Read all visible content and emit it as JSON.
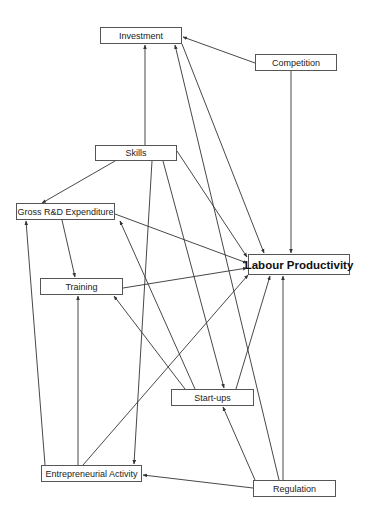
{
  "diagram": {
    "title": "",
    "nodes": [
      {
        "id": "investment",
        "label": "Investment",
        "x": 100,
        "y": 27,
        "w": 82,
        "h": 17
      },
      {
        "id": "competition",
        "label": "Competition",
        "x": 255,
        "y": 54,
        "w": 82,
        "h": 17
      },
      {
        "id": "skills",
        "label": "Skills",
        "x": 95,
        "y": 145,
        "w": 82,
        "h": 16
      },
      {
        "id": "gross_rd",
        "label": "Gross R&D Expenditure",
        "x": 16,
        "y": 203,
        "w": 99,
        "h": 17
      },
      {
        "id": "labour_productivity",
        "label": "Labour Productivity",
        "x": 248,
        "y": 254,
        "w": 102,
        "h": 21,
        "main": true
      },
      {
        "id": "training",
        "label": "Training",
        "x": 40,
        "y": 278,
        "w": 83,
        "h": 17
      },
      {
        "id": "startups",
        "label": "Start-ups",
        "x": 171,
        "y": 389,
        "w": 83,
        "h": 17
      },
      {
        "id": "entrepreneurial",
        "label": "Entrepreneurial Activity",
        "x": 41,
        "y": 465,
        "w": 101,
        "h": 17
      },
      {
        "id": "regulation",
        "label": "Regulation",
        "x": 253,
        "y": 480,
        "w": 83,
        "h": 17
      }
    ],
    "edges": [
      {
        "from": "competition",
        "to": "investment",
        "x1": 255,
        "y1": 63,
        "x2": 183,
        "y2": 37
      },
      {
        "from": "competition",
        "to": "labour_productivity",
        "x1": 291,
        "y1": 71,
        "x2": 291,
        "y2": 253
      },
      {
        "from": "skills",
        "to": "investment",
        "x1": 145,
        "y1": 145,
        "x2": 145,
        "y2": 45
      },
      {
        "from": "skills",
        "to": "gross_rd",
        "x1": 115,
        "y1": 161,
        "x2": 42,
        "y2": 203
      },
      {
        "from": "skills",
        "to": "labour_productivity",
        "x1": 177,
        "y1": 151,
        "x2": 247,
        "y2": 257
      },
      {
        "from": "skills",
        "to": "startups",
        "x1": 163,
        "y1": 161,
        "x2": 224,
        "y2": 388
      },
      {
        "from": "skills",
        "to": "entrepreneurial",
        "x1": 152,
        "y1": 161,
        "x2": 134,
        "y2": 464
      },
      {
        "from": "investment",
        "to": "labour_productivity",
        "x1": 182,
        "y1": 44,
        "x2": 264,
        "y2": 253
      },
      {
        "from": "regulation",
        "to": "investment",
        "x1": 279,
        "y1": 480,
        "x2": 175,
        "y2": 45
      },
      {
        "from": "gross_rd",
        "to": "training",
        "x1": 62,
        "y1": 220,
        "x2": 75,
        "y2": 277
      },
      {
        "from": "gross_rd",
        "to": "labour_productivity",
        "x1": 115,
        "y1": 214,
        "x2": 247,
        "y2": 263
      },
      {
        "from": "training",
        "to": "labour_productivity",
        "x1": 123,
        "y1": 288,
        "x2": 247,
        "y2": 268
      },
      {
        "from": "startups",
        "to": "gross_rd",
        "x1": 195,
        "y1": 389,
        "x2": 120,
        "y2": 221
      },
      {
        "from": "startups",
        "to": "training",
        "x1": 185,
        "y1": 389,
        "x2": 114,
        "y2": 296
      },
      {
        "from": "startups",
        "to": "labour_productivity",
        "x1": 236,
        "y1": 389,
        "x2": 270,
        "y2": 276
      },
      {
        "from": "entrepreneurial",
        "to": "gross_rd",
        "x1": 45,
        "y1": 465,
        "x2": 26,
        "y2": 221
      },
      {
        "from": "entrepreneurial",
        "to": "training",
        "x1": 78,
        "y1": 465,
        "x2": 78,
        "y2": 296
      },
      {
        "from": "entrepreneurial",
        "to": "labour_productivity",
        "x1": 83,
        "y1": 465,
        "x2": 248,
        "y2": 275
      },
      {
        "from": "regulation",
        "to": "startups",
        "x1": 255,
        "y1": 480,
        "x2": 223,
        "y2": 407
      },
      {
        "from": "regulation",
        "to": "entrepreneurial",
        "x1": 253,
        "y1": 488,
        "x2": 143,
        "y2": 475
      },
      {
        "from": "regulation",
        "to": "labour_productivity",
        "x1": 283,
        "y1": 480,
        "x2": 283,
        "y2": 276
      }
    ]
  },
  "style": {
    "line_color": "#333333",
    "node_border": "#555555",
    "background": "#ffffff"
  }
}
